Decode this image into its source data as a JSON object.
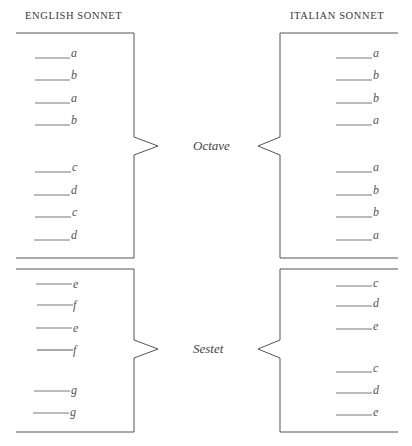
{
  "titles": {
    "left": "ENGLISH SONNET",
    "right": "ITALIAN SONNET"
  },
  "labels": {
    "octave": "Octave",
    "sestet": "Sestet"
  },
  "english": {
    "octave": [
      "a",
      "b",
      "a",
      "b",
      "c",
      "d",
      "c",
      "d"
    ],
    "sestet": [
      "e",
      "f",
      "e",
      "f",
      "g",
      "g"
    ]
  },
  "italian": {
    "octave": [
      "a",
      "b",
      "b",
      "a",
      "a",
      "b",
      "b",
      "a"
    ],
    "sestet": [
      "c",
      "d",
      "e",
      "c",
      "d",
      "e"
    ]
  }
}
